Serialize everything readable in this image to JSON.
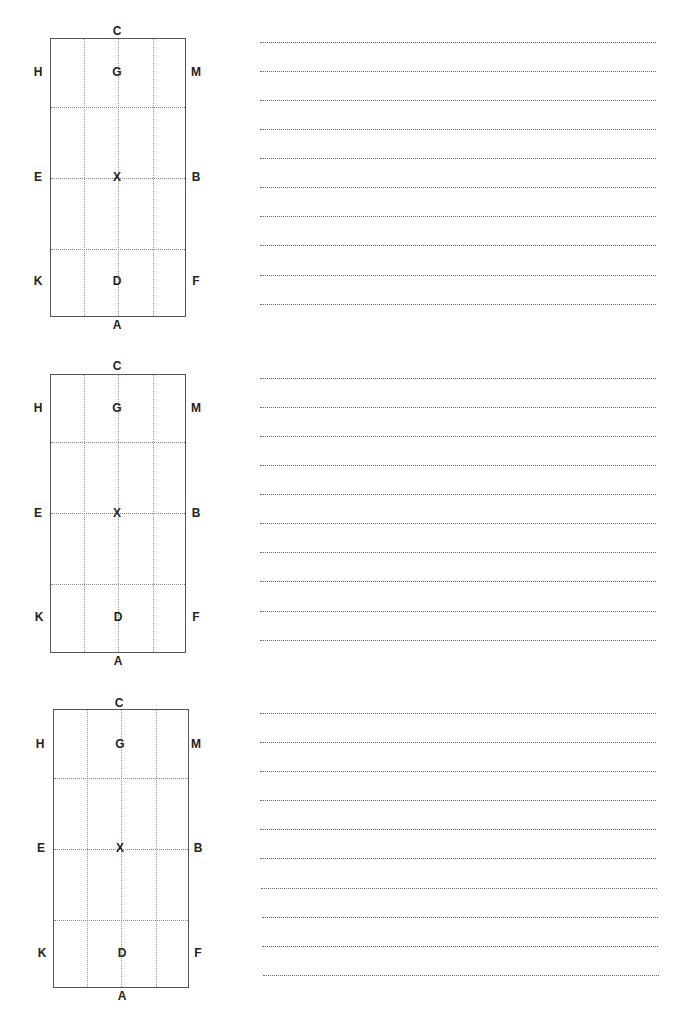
{
  "arenas": [
    {
      "box": {
        "left": 50,
        "top": 38,
        "width": 136,
        "height": 279
      },
      "letters": {
        "C": "C",
        "H": "H",
        "G": "G",
        "M": "M",
        "E": "E",
        "X": "X",
        "B": "B",
        "K": "K",
        "D": "D",
        "F": "F",
        "A": "A"
      },
      "writing_lines_y": [
        42,
        71,
        100,
        129,
        158,
        187,
        216,
        245,
        275,
        304
      ]
    },
    {
      "box": {
        "left": 50,
        "top": 374,
        "width": 136,
        "height": 279
      },
      "letters": {
        "C": "C",
        "H": "H",
        "G": "G",
        "M": "M",
        "E": "E",
        "X": "X",
        "B": "B",
        "K": "K",
        "D": "D",
        "F": "F",
        "A": "A"
      },
      "writing_lines_y": [
        378,
        407,
        436,
        465,
        494,
        523,
        552,
        581,
        611,
        640
      ]
    },
    {
      "box": {
        "left": 53,
        "top": 709,
        "width": 136,
        "height": 279
      },
      "letters": {
        "C": "C",
        "H": "H",
        "G": "G",
        "M": "M",
        "E": "E",
        "X": "X",
        "B": "B",
        "K": "K",
        "D": "D",
        "F": "F",
        "A": "A"
      },
      "writing_lines_y": [
        713,
        742,
        771,
        800,
        829,
        858,
        888,
        917,
        946,
        975
      ]
    }
  ],
  "writing_lines": {
    "left": 260,
    "right": 656
  },
  "colors": {
    "border": "#555555",
    "grid": "#999999",
    "text": "#222222"
  }
}
